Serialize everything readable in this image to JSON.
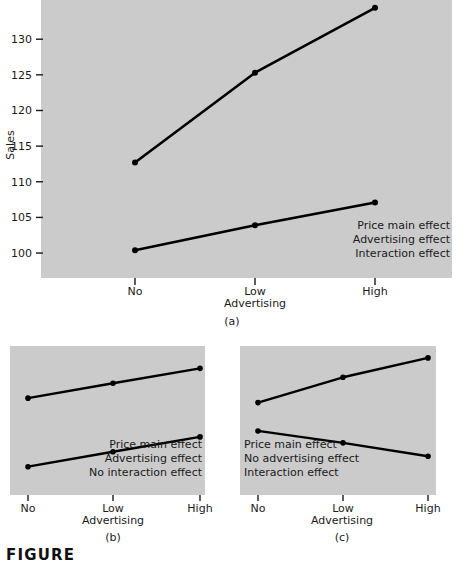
{
  "figure": {
    "label": "FIGURE"
  },
  "chart_data": [
    {
      "id": "a",
      "type": "line",
      "title": "",
      "caption": "(a)",
      "xlabel": "Advertising",
      "ylabel": "Sales",
      "categories": [
        "No",
        "Low",
        "High"
      ],
      "ytick_labels": [
        "100",
        "105",
        "110",
        "115",
        "120",
        "125",
        "130"
      ],
      "yticks": [
        100,
        105,
        110,
        115,
        120,
        125,
        130
      ],
      "ylim": [
        96.5,
        135.5
      ],
      "grid": false,
      "legend_position": "bottom-right",
      "legend": [
        "Price main effect",
        "Advertising effect",
        "Interaction effect"
      ],
      "series": [
        {
          "name": "Low price",
          "values": [
            112.7,
            125.3,
            134.4
          ]
        },
        {
          "name": "High price",
          "values": [
            100.4,
            103.9,
            107.1
          ]
        }
      ]
    },
    {
      "id": "b",
      "type": "line",
      "title": "",
      "caption": "(b)",
      "xlabel": "Advertising",
      "ylabel": "",
      "categories": [
        "No",
        "Low",
        "High"
      ],
      "ytick_labels": [],
      "yticks": [],
      "ylim": [
        0,
        10
      ],
      "grid": false,
      "legend_position": "bottom-right",
      "legend": [
        "Price main effect",
        "Advertising effect",
        "No interaction effect"
      ],
      "series": [
        {
          "name": "Low price",
          "values": [
            6.5,
            7.5,
            8.5
          ]
        },
        {
          "name": "High price",
          "values": [
            1.9,
            2.9,
            3.9
          ]
        }
      ]
    },
    {
      "id": "c",
      "type": "line",
      "title": "",
      "caption": "(c)",
      "xlabel": "Advertising",
      "ylabel": "",
      "categories": [
        "No",
        "Low",
        "High"
      ],
      "ytick_labels": [],
      "yticks": [],
      "ylim": [
        0,
        10
      ],
      "grid": false,
      "legend_position": "bottom-left",
      "legend": [
        "Price main effect",
        "No advertising effect",
        "Interaction effect"
      ],
      "series": [
        {
          "name": "Low price",
          "values": [
            6.2,
            7.9,
            9.2
          ]
        },
        {
          "name": "High price",
          "values": [
            4.3,
            3.5,
            2.6
          ]
        }
      ]
    }
  ]
}
